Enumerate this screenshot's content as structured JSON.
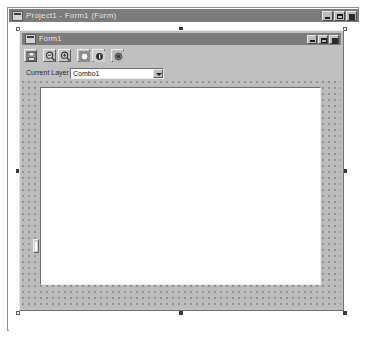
{
  "outer_window": {
    "title": "Project1 - Form1 (Form)",
    "icon": "vb-form-icon",
    "controls": [
      {
        "name": "minimize",
        "label": "_"
      },
      {
        "name": "maximize",
        "label": "□"
      },
      {
        "name": "close",
        "label": "×"
      }
    ]
  },
  "form_window": {
    "title": "Form1",
    "icon": "vb-form-icon",
    "controls": [
      {
        "name": "minimize",
        "label": "_"
      },
      {
        "name": "maximize",
        "label": "□"
      },
      {
        "name": "close",
        "label": "×"
      }
    ],
    "toolbar": {
      "buttons": [
        {
          "name": "save-icon",
          "tooltip": "Save"
        },
        {
          "name": "zoom-out-icon",
          "tooltip": "Zoom Out"
        },
        {
          "name": "zoom-in-icon",
          "tooltip": "Zoom In"
        },
        {
          "name": "circle-light-icon",
          "tooltip": "Light"
        },
        {
          "name": "circle-info-icon",
          "tooltip": "Info"
        },
        {
          "name": "circle-dark-icon",
          "tooltip": "Target"
        }
      ]
    },
    "layer": {
      "label": "Current Layer",
      "combo_value": "Combo1",
      "combo_name": "Combo1"
    },
    "canvas": {
      "name": "drawing-canvas",
      "background": "#ffffff"
    },
    "slider": {
      "name": "vertical-slider"
    }
  },
  "colors": {
    "titlebar": "#7c7c7c",
    "titlebar_text": "#ffffff",
    "window_face": "#c0c0c0",
    "grid_dot": "#8f8f8f",
    "grid_face": "#bcbcbc",
    "canvas": "#ffffff",
    "border_dark": "#707070",
    "border_light": "#e9e9e9"
  }
}
